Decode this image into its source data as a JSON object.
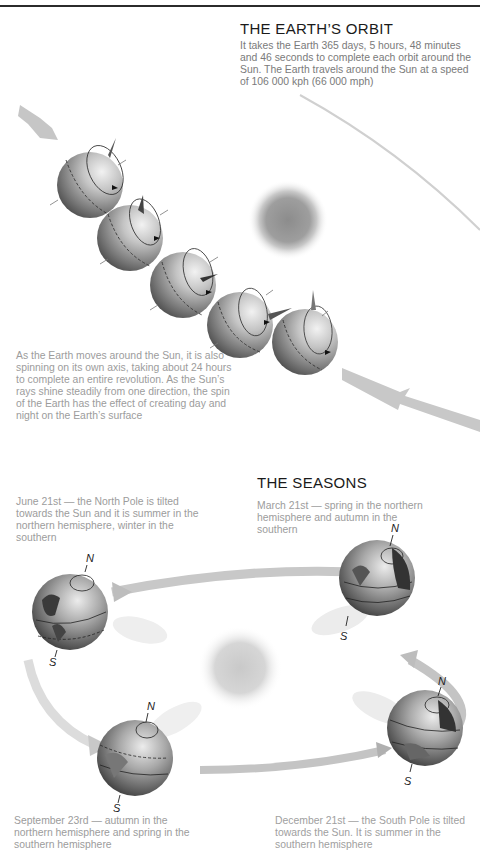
{
  "orbit_section": {
    "title": "THE EARTH’S ORBIT",
    "description": "It takes the Earth 365 days, 5 hours, 48 minutes and 46 seconds to complete each orbit around the Sun. The Earth travels around the Sun at a speed of 106 000 kph (66 000 mph)",
    "rotation_caption": "As the Earth moves around the Sun, it is also spinning on its own axis, taking about 24 hours to complete an entire revolution. As the Sun’s rays shine steadily from one direction, the spin of the Earth has the effect of creating day and night on the Earth’s surface",
    "illustration": {
      "sun_icon": "sun",
      "globe_count": 5,
      "globe_icon": "earth-globe-with-axis",
      "direction_arrows": [
        "incoming-arrow-top-left",
        "outgoing-arrow-bottom-right"
      ]
    }
  },
  "seasons_section": {
    "title": "THE SEASONS",
    "captions": {
      "june": "June 21st — the North Pole is tilted towards the Sun and it is summer in the northern hemisphere, winter in the southern",
      "march": "March 21st — spring in the northern hemisphere and autumn in the southern",
      "september": "September 23rd — autumn in the northern hemisphere and spring in the southern hemisphere",
      "december": "December 21st — the South Pole is tilted towards the Sun. It is summer in the southern hemisphere"
    },
    "pole_labels": {
      "north": "N",
      "south": "S"
    },
    "colors": {
      "globe_dark": "#3a3a3a",
      "globe_light": "#d8d8d8",
      "sun_core": "#9a9a9a",
      "arrow": "#c4c4c4"
    }
  }
}
